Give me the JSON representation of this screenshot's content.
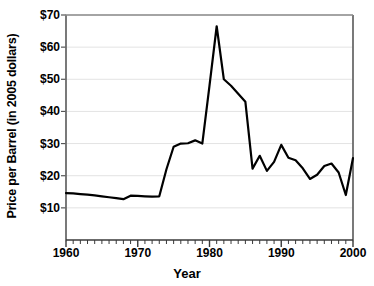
{
  "chart_data": {
    "type": "line",
    "title": "",
    "xlabel": "Year",
    "ylabel": "Price per Barrel (in 2005 dollars)",
    "xlim": [
      1960,
      2000
    ],
    "ylim": [
      0,
      70
    ],
    "xticks": [
      1960,
      1970,
      1980,
      1990,
      2000
    ],
    "xtick_labels": [
      "1960",
      "1970",
      "1980",
      "1990",
      "2000"
    ],
    "yticks": [
      10,
      20,
      30,
      40,
      50,
      60,
      70
    ],
    "ytick_labels": [
      "$10",
      "$20",
      "$30",
      "$40",
      "$50",
      "$60",
      "$70"
    ],
    "minor_xtick_interval": 1,
    "grid": "horizontal",
    "grid_color": "#e3e3e3",
    "line_color": "#000000",
    "line_width": 2.2,
    "legend": null,
    "x": [
      1960,
      1961,
      1962,
      1963,
      1964,
      1965,
      1966,
      1967,
      1968,
      1969,
      1970,
      1971,
      1972,
      1973,
      1974,
      1975,
      1976,
      1977,
      1978,
      1979,
      1980,
      1981,
      1982,
      1983,
      1984,
      1985,
      1986,
      1987,
      1988,
      1989,
      1990,
      1991,
      1992,
      1993,
      1994,
      1995,
      1996,
      1997,
      1998,
      1999,
      2000
    ],
    "values": [
      14.6,
      14.5,
      14.3,
      14.1,
      13.9,
      13.6,
      13.3,
      13.0,
      12.7,
      13.8,
      13.7,
      13.6,
      13.5,
      13.6,
      22.0,
      29.0,
      30.0,
      30.1,
      31.0,
      30.0,
      48.0,
      66.5,
      50.0,
      48.0,
      45.5,
      43.0,
      22.2,
      26.2,
      21.5,
      24.3,
      29.6,
      25.6,
      24.8,
      22.3,
      19.0,
      20.3,
      23.0,
      23.8,
      21.0,
      14.0,
      25.5
    ],
    "series_name": "Crude oil price per barrel"
  },
  "axis": {
    "plot_left_px": 66,
    "plot_right_px": 353,
    "plot_top_px": 15,
    "plot_bottom_px": 240
  }
}
